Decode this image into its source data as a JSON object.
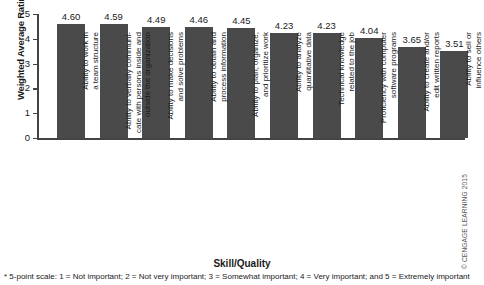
{
  "chart_data": {
    "type": "bar",
    "title": "",
    "xlabel": "Skill/Quality",
    "ylabel": "Weighted Average Rating*",
    "ylim": [
      0,
      5
    ],
    "yticks": [
      "0",
      "1",
      "2",
      "3",
      "4",
      "5"
    ],
    "grid": false,
    "legend": null,
    "bar_color": "#4a4a4a",
    "categories": [
      "Ability to work in\na team structure",
      "Ability to verbally communi-\ncate with persons inside and\noutside the organization",
      "Ability to make decisions\nand solve problems",
      "Ability to obtain and\nprocess information",
      "Ability to plan, organize,\nand prioritize work",
      "Ability to analyze\nquantitative data",
      "Technical knowledge\nrelated to the job",
      "Proficiency with computer\nsoftware programs",
      "Ability to create and/or\nedit written reports",
      "Ability to sell or\ninfluence others"
    ],
    "values": [
      4.6,
      4.59,
      4.49,
      4.46,
      4.45,
      4.23,
      4.23,
      4.04,
      3.65,
      3.51
    ],
    "value_labels": [
      "4.60",
      "4.59",
      "4.49",
      "4.46",
      "4.45",
      "4.23",
      "4.23",
      "4.04",
      "3.65",
      "3.51"
    ],
    "footnote": "* 5-point scale: 1 = Not important; 2 = Not very important; 3 = Somewhat important; 4 = Very important; and 5 = Extremely important"
  },
  "credit": {
    "text": "© CENGAGE LEARNING 2015"
  }
}
